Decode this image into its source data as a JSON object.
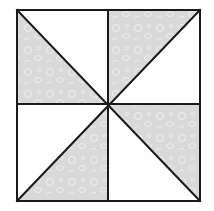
{
  "block": {
    "x": 17,
    "y": 10,
    "width": 183,
    "height": 191,
    "center": {
      "x": 108,
      "y": 104
    },
    "stroke": "#1a1a1a",
    "stroke_width": 2,
    "background": "#ffffff"
  },
  "fabric": {
    "shaded_fill": "#d9d9d9",
    "pattern_color": "#f2f2f2",
    "plain_fill": "#ffffff"
  },
  "quadrants": [
    {
      "name": "top-left",
      "shaded_half": "lower-left"
    },
    {
      "name": "top-right",
      "shaded_half": "upper-left"
    },
    {
      "name": "bottom-left",
      "shaded_half": "lower-right"
    },
    {
      "name": "bottom-right",
      "shaded_half": "upper-right"
    }
  ]
}
